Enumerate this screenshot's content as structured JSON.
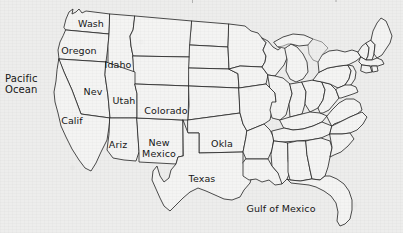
{
  "map": {
    "title": "United States outline map with selected state labels",
    "background_color": "#ededec",
    "line_color": "#222222",
    "land_fill": "#f4f4f3",
    "label_color": "#161616",
    "state_labels": [
      {
        "name": "Wash",
        "text": "Wash",
        "x": 91,
        "y": 24
      },
      {
        "name": "Oregon",
        "text": "Oregon",
        "x": 79,
        "y": 51
      },
      {
        "name": "Idaho",
        "text": "Idaho",
        "x": 118,
        "y": 65
      },
      {
        "name": "Nev",
        "text": "Nev",
        "x": 93,
        "y": 92
      },
      {
        "name": "Utah",
        "text": "Utah",
        "x": 124,
        "y": 101
      },
      {
        "name": "Calif",
        "text": "Calif",
        "x": 72,
        "y": 121
      },
      {
        "name": "Colorado",
        "text": "Colorado",
        "x": 166,
        "y": 111
      },
      {
        "name": "Ariz",
        "text": "Ariz",
        "x": 118,
        "y": 145
      },
      {
        "name": "NewMexico",
        "text": "New\nMexico",
        "x": 159,
        "y": 148
      },
      {
        "name": "Okla",
        "text": "Okla",
        "x": 222,
        "y": 144
      },
      {
        "name": "Texas",
        "text": "Texas",
        "x": 202,
        "y": 179
      }
    ],
    "water_labels": [
      {
        "name": "PacificOcean",
        "text": "Pacific\nOcean",
        "x": 5,
        "y": 84
      },
      {
        "name": "GulfOfMexico",
        "text": "Gulf of Mexico",
        "x": 281,
        "y": 209
      }
    ]
  }
}
